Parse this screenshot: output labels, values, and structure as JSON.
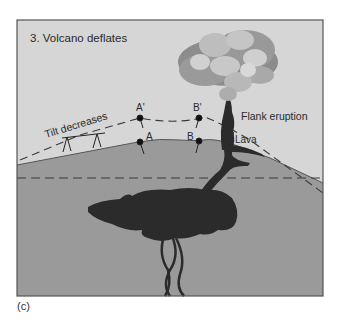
{
  "figure": {
    "panel_title": "3. Volcano deflates",
    "caption": "(c)",
    "labels": {
      "tilt": "Tilt decreases",
      "flank_eruption": "Flank eruption",
      "lava": "Lava",
      "point_a": "A",
      "point_b": "B",
      "point_a_prime": "A'",
      "point_b_prime": "B'"
    },
    "colors": {
      "sky": "#d6d6d6",
      "ground": "#9a9a9a",
      "magma": "#2b2b2b",
      "frame": "#555555",
      "ash_dark": "#8c8c8c",
      "ash_mid": "#a8a8a8",
      "ash_light": "#cfcfcf"
    }
  }
}
